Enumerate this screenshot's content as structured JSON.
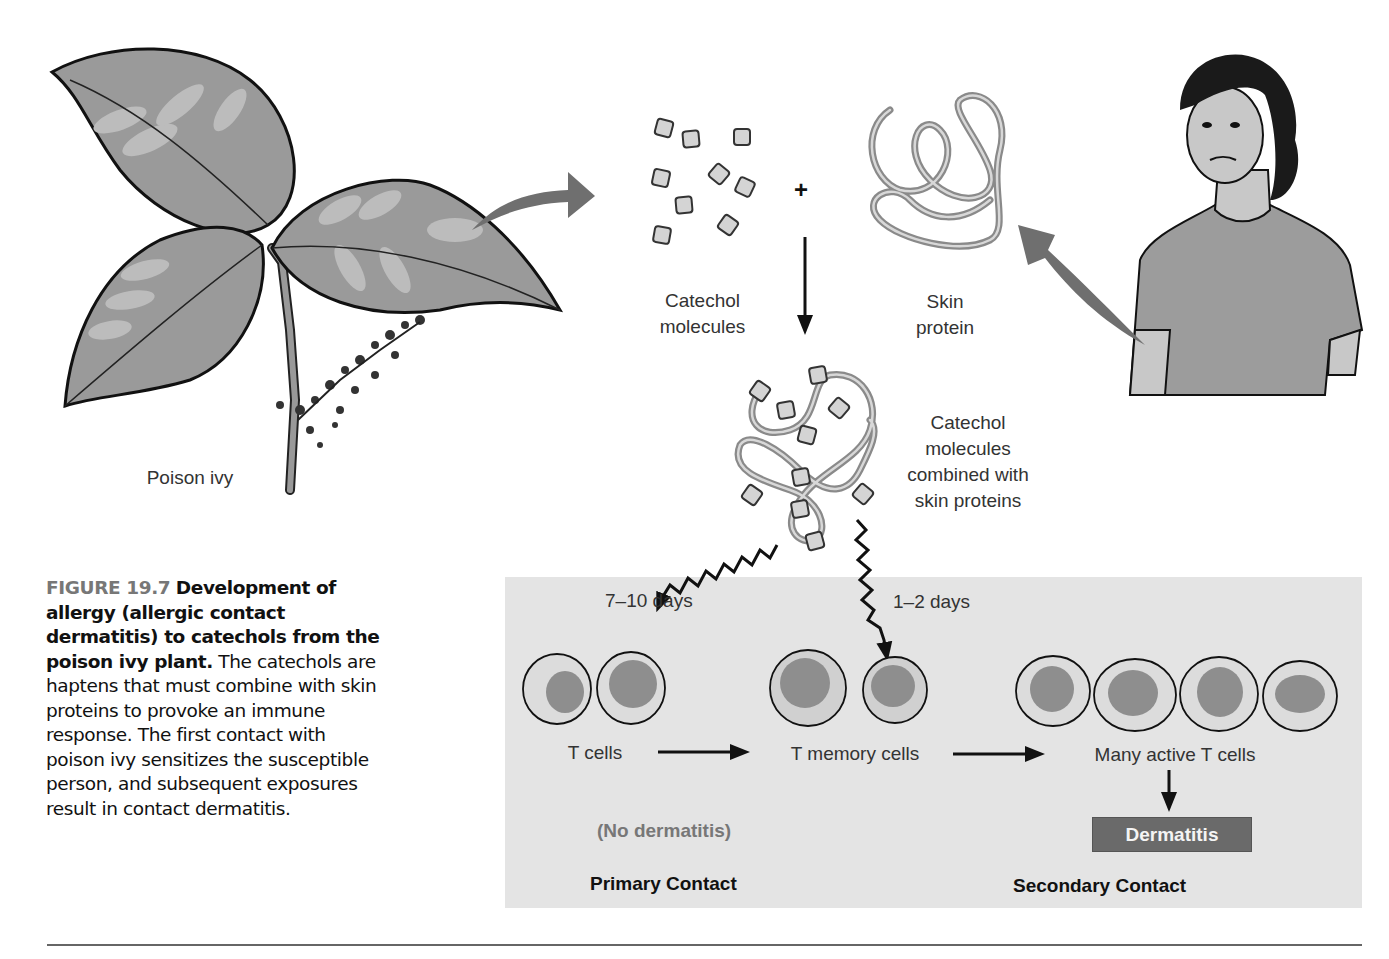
{
  "figure": {
    "number_label": "FIGURE 19.7",
    "title_bold": "Development of allergy (allergic contact dermatitis) to catechols from the poison ivy plant.",
    "body": "The catechols are haptens that must combine with skin proteins to provoke an immune response. The first contact with poison ivy sensitizes the susceptible person, and subsequent exposures result in contact dermatitis."
  },
  "diagram": {
    "plant_label": "Poison ivy",
    "catechol_label_line1": "Catechol",
    "catechol_label_line2": "molecules",
    "plus_sign": "+",
    "skin_protein_line1": "Skin",
    "skin_protein_line2": "protein",
    "combined_line1": "Catechol",
    "combined_line2": "molecules",
    "combined_line3": "combined with",
    "combined_line4": "skin proteins",
    "primary_time": "7–10 days",
    "secondary_time": "1–2 days",
    "t_cells": "T cells",
    "t_memory_cells": "T memory cells",
    "many_active": "Many active T cells",
    "no_dermatitis": "(No dermatitis)",
    "dermatitis": "Dermatitis",
    "primary_contact": "Primary Contact",
    "secondary_contact": "Secondary Contact"
  },
  "colors": {
    "panel": "#e4e4e4",
    "dermatitis_box": "#6a6a6a",
    "figure_label": "#777777",
    "arrow_gray": "#6f6f6f",
    "leaf": "#9a9a9a"
  }
}
